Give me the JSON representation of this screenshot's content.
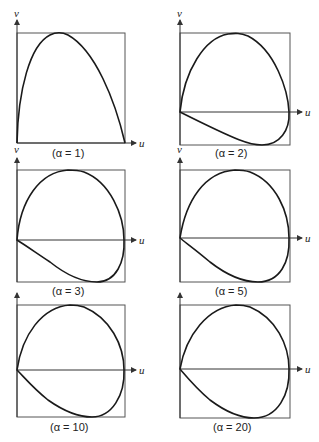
{
  "figure": {
    "panels": [
      {
        "id": "a1",
        "caption": "(α = 1)",
        "x_axis_label": "u",
        "y_axis_label": "v"
      },
      {
        "id": "a2",
        "caption": "(α = 2)",
        "x_axis_label": "u",
        "y_axis_label": "v"
      },
      {
        "id": "a3",
        "caption": "(α = 3)",
        "x_axis_label": "u",
        "y_axis_label": "v"
      },
      {
        "id": "a5",
        "caption": "(α = 5)",
        "x_axis_label": "u",
        "y_axis_label": "v"
      },
      {
        "id": "a10",
        "caption": "(α = 10)",
        "x_axis_label": "u",
        "y_axis_label": "v"
      },
      {
        "id": "a20",
        "caption": "(α = 20)",
        "x_axis_label": "u",
        "y_axis_label": "v"
      }
    ]
  },
  "colors": {
    "curve": "#1a1a1a",
    "frame": "#555555",
    "background": "#ffffff"
  }
}
